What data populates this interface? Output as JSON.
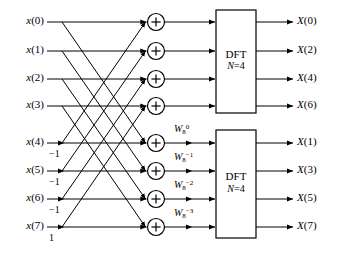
{
  "figure": {
    "type": "fft-butterfly-signal-flow-graph",
    "line_color": "#000000",
    "background": "#ffffff"
  },
  "inputs": [
    {
      "label": "x(0)",
      "base": "x",
      "index": "0",
      "y": 22
    },
    {
      "label": "x(1)",
      "base": "x",
      "index": "1",
      "y": 51
    },
    {
      "label": "x(2)",
      "base": "x",
      "index": "2",
      "y": 79
    },
    {
      "label": "x(3)",
      "base": "x",
      "index": "3",
      "y": 106
    },
    {
      "label": "x(4)",
      "base": "x",
      "index": "4",
      "y": 143
    },
    {
      "label": "x(5)",
      "base": "x",
      "index": "5",
      "y": 171
    },
    {
      "label": "x(6)",
      "base": "x",
      "index": "6",
      "y": 199
    },
    {
      "label": "x(7)",
      "base": "x",
      "index": "7",
      "y": 227
    }
  ],
  "gains": [
    {
      "label": "−1",
      "row": 4,
      "y": 156
    },
    {
      "label": "−1",
      "row": 5,
      "y": 184
    },
    {
      "label": "−1",
      "row": 6,
      "y": 212
    },
    {
      "label": "1",
      "row": 7,
      "y": 240
    }
  ],
  "adders": [
    {
      "name": "adder-0",
      "symbol": "+",
      "y": 22
    },
    {
      "name": "adder-1",
      "symbol": "+",
      "y": 51
    },
    {
      "name": "adder-2",
      "symbol": "+",
      "y": 79
    },
    {
      "name": "adder-3",
      "symbol": "+",
      "y": 106
    },
    {
      "name": "adder-4",
      "symbol": "+",
      "y": 143
    },
    {
      "name": "adder-5",
      "symbol": "+",
      "y": 171
    },
    {
      "name": "adder-6",
      "symbol": "+",
      "y": 199
    },
    {
      "name": "adder-7",
      "symbol": "+",
      "y": 227
    }
  ],
  "twiddles": [
    {
      "base": "W",
      "sub": "8",
      "sup": "0",
      "text": "W8^0",
      "row": 4,
      "y": 131
    },
    {
      "base": "W",
      "sub": "8",
      "sup": "−1",
      "text": "W8^-1",
      "row": 5,
      "y": 159
    },
    {
      "base": "W",
      "sub": "8",
      "sup": "−2",
      "text": "W8^-2",
      "row": 6,
      "y": 187
    },
    {
      "base": "W",
      "sub": "8",
      "sup": "−3",
      "text": "W8^-3",
      "row": 7,
      "y": 215
    }
  ],
  "blocks": [
    {
      "name": "dft-block-top",
      "title": "DFT",
      "size_label": "N=4",
      "size_var": "N",
      "size_value": "=4",
      "x": 216,
      "y": 10,
      "w": 40,
      "h": 103
    },
    {
      "name": "dft-block-bottom",
      "title": "DFT",
      "size_label": "N=4",
      "size_var": "N",
      "size_value": "=4",
      "x": 216,
      "y": 130,
      "w": 40,
      "h": 108
    }
  ],
  "outputs": [
    {
      "label": "X(0)",
      "base": "X",
      "index": "0",
      "y": 22
    },
    {
      "label": "X(2)",
      "base": "X",
      "index": "2",
      "y": 51
    },
    {
      "label": "X(4)",
      "base": "X",
      "index": "4",
      "y": 79
    },
    {
      "label": "X(6)",
      "base": "X",
      "index": "6",
      "y": 106
    },
    {
      "label": "X(1)",
      "base": "X",
      "index": "1",
      "y": 143
    },
    {
      "label": "X(3)",
      "base": "X",
      "index": "3",
      "y": 171
    },
    {
      "label": "X(5)",
      "base": "X",
      "index": "5",
      "y": 199
    },
    {
      "label": "X(7)",
      "base": "X",
      "index": "7",
      "y": 227
    }
  ]
}
